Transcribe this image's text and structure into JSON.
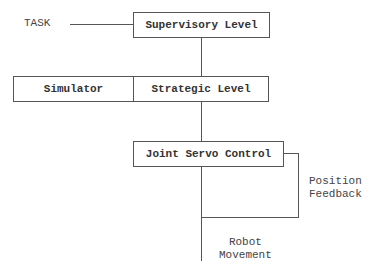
{
  "diagram": {
    "type": "hierarchical control block diagram",
    "nodes": {
      "supervisory": "Supervisory Level",
      "simulator": "Simulator",
      "strategic": "Strategic Level",
      "joint_servo": "Joint Servo Control"
    },
    "labels": {
      "task": "TASK",
      "position_feedback_line1": "Position",
      "position_feedback_line2": "Feedback",
      "robot_movement_line1": "Robot",
      "robot_movement_line2": "Movement"
    },
    "edges": [
      {
        "from": "TASK",
        "to": "Supervisory Level"
      },
      {
        "from": "Supervisory Level",
        "to": "Strategic Level"
      },
      {
        "from": "Simulator",
        "to": "Strategic Level",
        "relation": "adjacent"
      },
      {
        "from": "Strategic Level",
        "to": "Joint Servo Control"
      },
      {
        "from": "Joint Servo Control",
        "to": "Robot Movement"
      },
      {
        "from": "Robot Movement",
        "to": "Joint Servo Control",
        "label": "Position Feedback"
      }
    ]
  }
}
